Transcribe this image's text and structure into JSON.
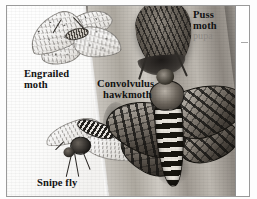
{
  "plate": {
    "medium": "black-and-white scientific illustration",
    "scene": "tree trunk with camouflaged insects",
    "border_color": "#9a9a9a",
    "background_color": "#ffffff"
  },
  "labels": [
    {
      "id": "puss-moth",
      "name": "Puss moth",
      "line1": "Puss",
      "line2": "moth",
      "sub": "pupa",
      "color": "#121212",
      "sub_color": "#8e8a85"
    },
    {
      "id": "engrailed-moth",
      "name": "Engrailed moth",
      "line1": "Engrailed",
      "line2": "moth",
      "color": "#121212"
    },
    {
      "id": "convolvulus-hawkmoth",
      "name": "Convolvulus hawkmoth",
      "line1": "Convolvulus",
      "line2": "hawkmoth",
      "color": "#121212"
    },
    {
      "id": "snipe-fly",
      "name": "Snipe fly",
      "line1": "Snipe fly",
      "color": "#121212"
    }
  ],
  "subjects": [
    {
      "id": "puss-moth-pupa",
      "label": "Puss moth pupa",
      "position": "upper centre-right, on trunk"
    },
    {
      "id": "engrailed-moth",
      "label": "Engrailed moth",
      "position": "upper left, wings spread"
    },
    {
      "id": "convolvulus-hawkmoth",
      "label": "Convolvulus hawkmoth",
      "position": "right, large striped abdomen"
    },
    {
      "id": "snipe-fly",
      "label": "Snipe fly",
      "position": "lower left, banded abdomen"
    },
    {
      "id": "tree-trunk",
      "label": "Tree trunk",
      "position": "diagonal through centre"
    }
  ]
}
